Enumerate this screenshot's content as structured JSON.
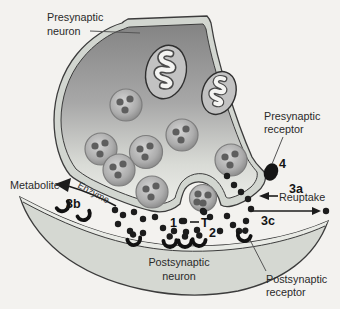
{
  "diagram": {
    "labels": {
      "presynaptic_neuron": [
        "Presynaptic",
        "neuron"
      ],
      "presynaptic_receptor": [
        "Presynaptic",
        "receptor"
      ],
      "postsynaptic_neuron": [
        "Postsynaptic",
        "neuron"
      ],
      "postsynaptic_receptor": [
        "Postsynaptic",
        "receptor"
      ],
      "metabolite": "Metabolite",
      "enzyme": "Enzyme",
      "reuptake": "Reuptake",
      "transmitter": "T"
    },
    "steps": {
      "release": "1",
      "binding": "2",
      "reuptake": "3a",
      "degradation": "3b",
      "diffusion": "3c",
      "presynaptic_receptor": "4"
    },
    "colors": {
      "background": "#f3f2ef",
      "membrane_band": "#d2d6d0",
      "postsynaptic_band": "#e8eae5",
      "postsynaptic_fill": "#d5d8d2",
      "outline": "#3c3c3c",
      "cytoplasm_dark": "#858585",
      "cytoplasm_light": "#edeeea",
      "vesicle_dot": "#5e5e5e",
      "transmitter_dot": "#1c1c1c",
      "receptor": "#111111",
      "text": "#2a2a2a"
    },
    "vesicles": [
      {
        "x": 126,
        "y": 105,
        "r": 16
      },
      {
        "x": 101,
        "y": 149,
        "r": 16
      },
      {
        "x": 146,
        "y": 152,
        "r": 16.5
      },
      {
        "x": 182,
        "y": 135,
        "r": 16
      },
      {
        "x": 119,
        "y": 170,
        "r": 16
      },
      {
        "x": 152,
        "y": 192,
        "r": 16
      },
      {
        "x": 231,
        "y": 160,
        "r": 16
      },
      {
        "x": 203,
        "y": 198,
        "r": 13.5,
        "fused": true,
        "dots": [
          [
            -5,
            -4
          ],
          [
            5,
            -3
          ],
          [
            0,
            5
          ],
          [
            -6,
            4
          ]
        ]
      }
    ],
    "transmitter_dots": [
      [
        227,
        176
      ],
      [
        234,
        185
      ],
      [
        241,
        192
      ],
      [
        248,
        199
      ],
      [
        115,
        210
      ],
      [
        123,
        215
      ],
      [
        134,
        212
      ],
      [
        143,
        219
      ],
      [
        118,
        224
      ],
      [
        130,
        231
      ],
      [
        143,
        233
      ],
      [
        155,
        217
      ],
      [
        163,
        228
      ],
      [
        174,
        231
      ],
      [
        186,
        232
      ],
      [
        197,
        230
      ],
      [
        182,
        221
      ],
      [
        184,
        221
      ],
      [
        204,
        212
      ],
      [
        203,
        211
      ],
      [
        210,
        217
      ],
      [
        220,
        231
      ],
      [
        227,
        216
      ],
      [
        233,
        225
      ],
      [
        239,
        231
      ],
      [
        246,
        221
      ],
      [
        251,
        209
      ],
      [
        326,
        211
      ]
    ],
    "bound_receptors": [
      {
        "x": 134,
        "y": 240,
        "rot": -10
      },
      {
        "x": 170,
        "y": 242,
        "rot": -3
      },
      {
        "x": 185,
        "y": 242,
        "rot": 0
      },
      {
        "x": 199,
        "y": 241,
        "rot": 3
      },
      {
        "x": 244,
        "y": 236,
        "rot": 13
      }
    ],
    "empty_receptors": [
      {
        "x": 63,
        "y": 206,
        "rot": -32
      },
      {
        "x": 84,
        "y": 215,
        "rot": -26
      }
    ]
  }
}
